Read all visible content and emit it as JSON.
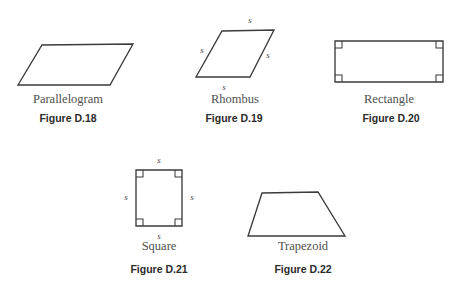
{
  "chart_data": {
    "type": "diagram",
    "figures": [
      {
        "id": "parallelogram",
        "shape_name": "Parallelogram",
        "caption": "Figure D.18",
        "points": "42,45 133,44 110,85 18,85",
        "side_labels": [],
        "right_angles": []
      },
      {
        "id": "rhombus",
        "shape_name": "Rhombus",
        "caption": "Figure D.19",
        "points": "222,31 274,30 250,77 196,77",
        "side_labels": [
          {
            "text": "s",
            "x": 250,
            "y": 20
          },
          {
            "text": "s",
            "x": 268,
            "y": 55
          },
          {
            "text": "s",
            "x": 224,
            "y": 87
          },
          {
            "text": "s",
            "x": 202,
            "y": 50
          }
        ],
        "right_angles": []
      },
      {
        "id": "rectangle",
        "shape_name": "Rectangle",
        "caption": "Figure D.20",
        "points": "335,41 443,41 443,82 335,82",
        "side_labels": [],
        "right_angles": [
          {
            "x": 335,
            "y": 41,
            "dx": 1,
            "dy": 1
          },
          {
            "x": 443,
            "y": 41,
            "dx": -1,
            "dy": 1
          },
          {
            "x": 443,
            "y": 82,
            "dx": -1,
            "dy": -1
          },
          {
            "x": 335,
            "y": 82,
            "dx": 1,
            "dy": -1
          }
        ]
      },
      {
        "id": "square",
        "shape_name": "Square",
        "caption": "Figure D.21",
        "points": "136,170 182,170 182,226 136,226",
        "side_labels": [
          {
            "text": "s",
            "x": 159,
            "y": 160
          },
          {
            "text": "s",
            "x": 192,
            "y": 197
          },
          {
            "text": "s",
            "x": 159,
            "y": 236
          },
          {
            "text": "s",
            "x": 126,
            "y": 197
          }
        ],
        "right_angles": [
          {
            "x": 136,
            "y": 170,
            "dx": 1,
            "dy": 1
          },
          {
            "x": 182,
            "y": 170,
            "dx": -1,
            "dy": 1
          },
          {
            "x": 182,
            "y": 226,
            "dx": -1,
            "dy": -1
          },
          {
            "x": 136,
            "y": 226,
            "dx": 1,
            "dy": -1
          }
        ]
      },
      {
        "id": "trapezoid",
        "shape_name": "Trapezoid",
        "caption": "Figure D.22",
        "points": "262,193 318,192 345,236 248,236",
        "side_labels": [],
        "right_angles": []
      }
    ],
    "name_positions": [
      {
        "x": 68,
        "y": 93
      },
      {
        "x": 235,
        "y": 93
      },
      {
        "x": 389,
        "y": 93
      },
      {
        "x": 159,
        "y": 240
      },
      {
        "x": 303,
        "y": 240
      }
    ],
    "caption_positions": [
      {
        "x": 68,
        "y": 113
      },
      {
        "x": 234,
        "y": 113
      },
      {
        "x": 391,
        "y": 113
      },
      {
        "x": 159,
        "y": 264
      },
      {
        "x": 303,
        "y": 264
      }
    ],
    "style": {
      "stroke_color": "#3b3b3b",
      "fill_color": "#ffffff",
      "label_color": "#4a4a4a",
      "name_color": "#4f4f4f",
      "caption_color": "#2b2b2b",
      "background": "#ffffff"
    }
  }
}
